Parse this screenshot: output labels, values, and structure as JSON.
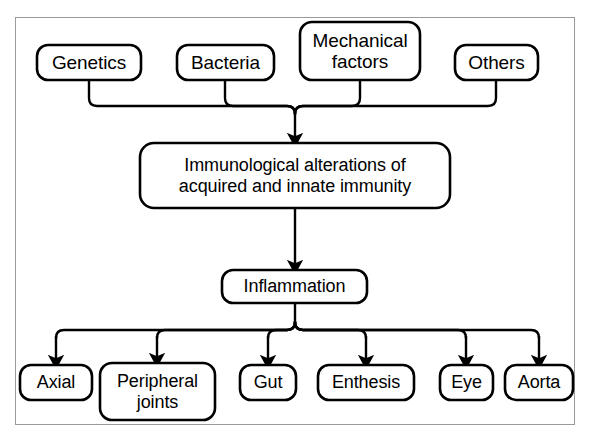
{
  "figure": {
    "orientation": "top-down",
    "frame_color": "#9a9a9a",
    "line_color": "#000000",
    "background_color": "#ffffff"
  },
  "nodes": {
    "causes": [
      {
        "id": "genetics",
        "label": "Genetics",
        "x": 37,
        "y": 45,
        "w": 104,
        "h": 35,
        "font": 19
      },
      {
        "id": "bacteria",
        "label": "Bacteria",
        "x": 177,
        "y": 45,
        "w": 97,
        "h": 35,
        "font": 19
      },
      {
        "id": "mechanical-factors",
        "label": "Mechanical\nfactors",
        "x": 300,
        "y": 22,
        "w": 120,
        "h": 58,
        "font": 19
      },
      {
        "id": "others",
        "label": "Others",
        "x": 455,
        "y": 45,
        "w": 83,
        "h": 35,
        "font": 19
      }
    ],
    "process": {
      "id": "immunological-alterations",
      "label": "Immunological alterations of\nacquired and innate immunity",
      "x": 140,
      "y": 143,
      "w": 310,
      "h": 65,
      "font": 18
    },
    "intermediate": {
      "id": "inflammation",
      "label": "Inflammation",
      "x": 222,
      "y": 270,
      "w": 145,
      "h": 33,
      "font": 18
    },
    "outcomes": [
      {
        "id": "axial",
        "label": "Axial",
        "x": 20,
        "y": 365,
        "w": 72,
        "h": 35,
        "font": 18
      },
      {
        "id": "peripheral-joints",
        "label": "Peripheral\njoints",
        "x": 100,
        "y": 363,
        "w": 115,
        "h": 57,
        "font": 18
      },
      {
        "id": "gut",
        "label": "Gut",
        "x": 240,
        "y": 365,
        "w": 56,
        "h": 35,
        "font": 18
      },
      {
        "id": "enthesis",
        "label": "Enthesis",
        "x": 318,
        "y": 365,
        "w": 96,
        "h": 35,
        "font": 18
      },
      {
        "id": "eye",
        "label": "Eye",
        "x": 440,
        "y": 365,
        "w": 53,
        "h": 35,
        "font": 18
      },
      {
        "id": "aorta",
        "label": "Aorta",
        "x": 505,
        "y": 365,
        "w": 68,
        "h": 35,
        "font": 18
      }
    ]
  },
  "connectors": {
    "top_bus_y": 106,
    "top_merge_x": 295,
    "bottom_bus_y": 330,
    "bottom_source_x": 295,
    "cause_stem_xs": [
      89,
      225,
      360,
      496
    ],
    "outcome_stem_xs": [
      56,
      157,
      268,
      366,
      466,
      539
    ],
    "arrow_into_process_y": 143,
    "arrow_into_inflammation_y": 270,
    "arrow_into_outcomes_y": 363
  }
}
